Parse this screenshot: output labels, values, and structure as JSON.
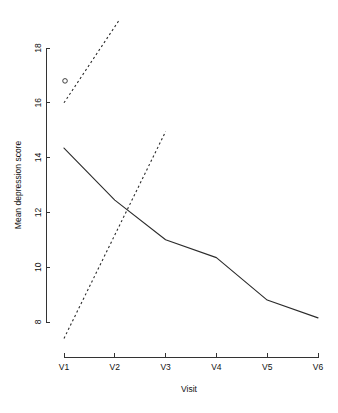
{
  "chart_data": {
    "type": "line",
    "title": "",
    "xlabel": "Visit",
    "ylabel": "Mean depression score",
    "categories": [
      "V1",
      "V2",
      "V3",
      "V4",
      "V5",
      "V6"
    ],
    "x": [
      1,
      2,
      3,
      4,
      5,
      6
    ],
    "xlim": [
      1,
      6
    ],
    "ylim": [
      7.4,
      19.0
    ],
    "yticks": [
      8,
      10,
      12,
      14,
      16,
      18
    ],
    "ytick_labels": [
      "8",
      "10",
      "12",
      "14",
      "16",
      "18"
    ],
    "xtick_labels": [
      "V1",
      "V2",
      "V3",
      "V4",
      "V5",
      "V6"
    ],
    "grid": false,
    "legend": "none",
    "series": [
      {
        "name": "Mean depression score",
        "style": "solid",
        "x": [
          1,
          2,
          3,
          4,
          5,
          6
        ],
        "values": [
          14.35,
          12.45,
          11.0,
          10.35,
          8.8,
          8.15
        ]
      },
      {
        "name": "Upper dashed trend",
        "style": "dashed",
        "x": [
          1,
          2.08
        ],
        "values": [
          16.0,
          19.0
        ]
      },
      {
        "name": "Lower dashed trend",
        "style": "dashed",
        "x": [
          1,
          3.0
        ],
        "values": [
          7.4,
          14.95
        ]
      }
    ],
    "markers": [
      {
        "name": "open-circle-point",
        "x": 1.02,
        "y": 16.8,
        "symbol": "o"
      }
    ],
    "annotations": []
  },
  "axes": {
    "y_axis_name": "y-axis",
    "x_axis_name": "x-axis"
  }
}
